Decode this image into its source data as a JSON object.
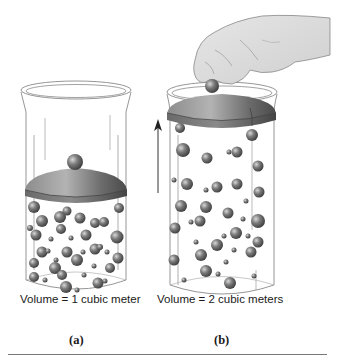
{
  "figure": {
    "panels": [
      {
        "id": "a",
        "label": "(a)",
        "caption": "Volume = 1 cubic meter",
        "description": "Cylinder with piston lid resting low; gas molecules packed densely"
      },
      {
        "id": "b",
        "label": "(b)",
        "caption": "Volume = 2 cubic meters",
        "description": "Hand lifts piston lid to top; arrow points up; gas molecules spread out"
      }
    ],
    "arrow_direction": "up",
    "colors": {
      "molecule": "#6b6b6b",
      "lid": "#5e5e5e",
      "outline": "#8a8a8a",
      "rule": "#777777"
    }
  }
}
